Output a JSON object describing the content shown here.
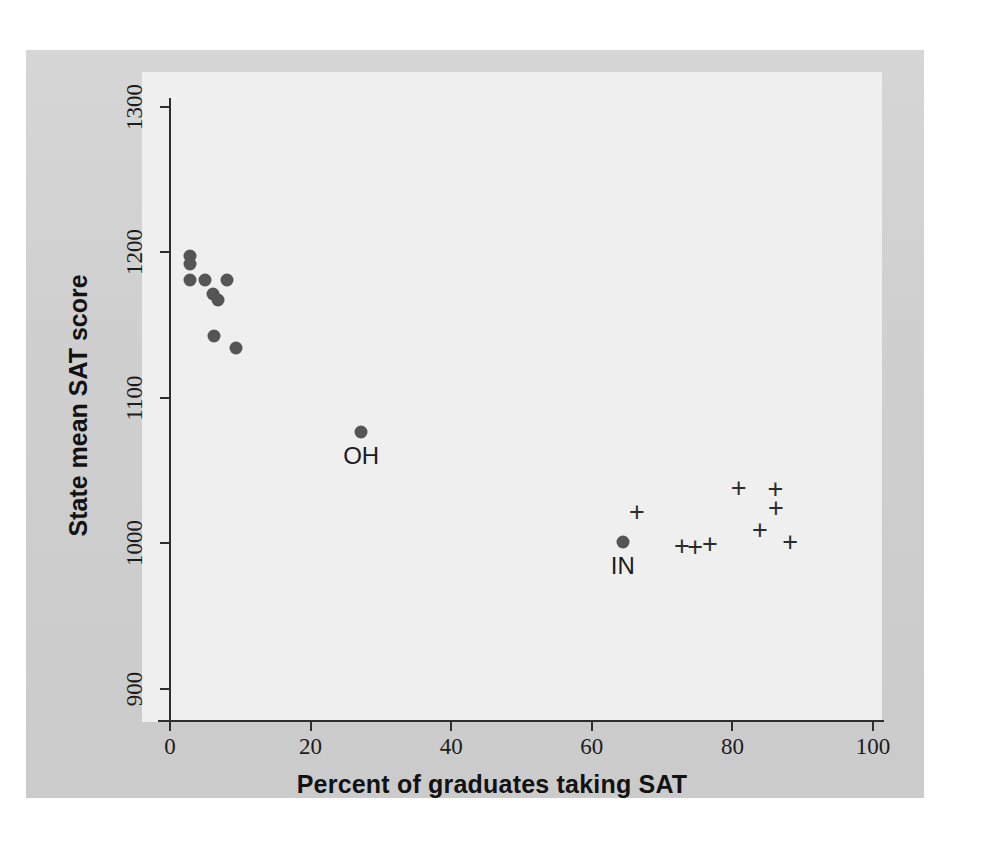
{
  "chart_data": {
    "type": "scatter",
    "title": "",
    "xlabel": "Percent of graduates taking SAT",
    "ylabel": "State mean SAT score",
    "xlim": [
      0,
      100
    ],
    "ylim": [
      900,
      1300
    ],
    "grid": false,
    "legend": "none",
    "xticks": [
      0,
      20,
      40,
      60,
      80,
      100
    ],
    "yticks": [
      900,
      1000,
      1100,
      1200,
      1300
    ],
    "xtick_labels": [
      "0",
      "20",
      "40",
      "60",
      "80",
      "100"
    ],
    "ytick_labels": [
      "900",
      "1000",
      "1100",
      "1200",
      "1300"
    ],
    "series": [
      {
        "name": "ACT-majority states",
        "marker": "filled-circle",
        "color": "#555555",
        "points": [
          {
            "x": 2.8,
            "y": 1197
          },
          {
            "x": 2.8,
            "y": 1192
          },
          {
            "x": 2.8,
            "y": 1181
          },
          {
            "x": 5.0,
            "y": 1181
          },
          {
            "x": 8.1,
            "y": 1181
          },
          {
            "x": 6.1,
            "y": 1171
          },
          {
            "x": 6.8,
            "y": 1167
          },
          {
            "x": 6.3,
            "y": 1142
          },
          {
            "x": 9.4,
            "y": 1134
          },
          {
            "x": 27.2,
            "y": 1076,
            "label": "OH"
          },
          {
            "x": 64.4,
            "y": 1001,
            "label": "IN"
          }
        ]
      },
      {
        "name": "SAT-majority states",
        "marker": "plus",
        "color": "#2b2b2b",
        "points": [
          {
            "x": 66.4,
            "y": 1021
          },
          {
            "x": 72.8,
            "y": 998
          },
          {
            "x": 74.7,
            "y": 997
          },
          {
            "x": 76.8,
            "y": 999
          },
          {
            "x": 80.9,
            "y": 1038
          },
          {
            "x": 83.9,
            "y": 1009
          },
          {
            "x": 86.1,
            "y": 1037
          },
          {
            "x": 86.2,
            "y": 1024
          },
          {
            "x": 88.2,
            "y": 1001
          }
        ]
      }
    ],
    "annotations": [
      {
        "text": "OH",
        "x": 27.2,
        "y": 1076
      },
      {
        "text": "IN",
        "x": 64.4,
        "y": 1001
      }
    ]
  },
  "colors": {
    "page_background": "#ffffff",
    "scan_background": "#d2d2d2",
    "panel_background": "#efefef",
    "axis": "#2e2e2e",
    "dot_marker": "#555555",
    "plus_marker": "#2b2b2b",
    "text": "#1c1c1c"
  },
  "marker_glyphs": {
    "plus": "+"
  }
}
